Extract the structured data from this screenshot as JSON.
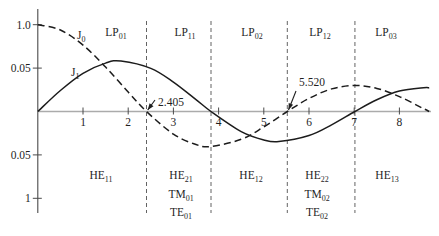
{
  "figure": {
    "background": "#ffffff",
    "text_color": "#1f1f1f",
    "curve_color": "#1c1c1c",
    "axis_color": "#ababab",
    "tick_color": "#4a4a4a",
    "cutoff_line_color": "#636363"
  },
  "chart_data": {
    "type": "line",
    "title": "",
    "xlabel": "",
    "ylabel": "",
    "xlim": [
      0,
      8.9
    ],
    "ylim": [
      -1.17,
      1.17
    ],
    "grid": false,
    "legend": "none",
    "x_ticks": [
      "1",
      "2",
      "3",
      "4",
      "5",
      "6",
      "7",
      "8"
    ],
    "y_ticks": [
      {
        "label": "1.0",
        "value": 1.0
      },
      {
        "label": "0.05",
        "value": 0.5
      },
      {
        "label": "0.05",
        "value": -0.5
      },
      {
        "label": "1",
        "value": -1.0
      }
    ],
    "series": [
      {
        "name": "J0",
        "label_main": "J",
        "label_sub": "0",
        "style": "dashed",
        "points": [
          [
            0,
            1.0
          ],
          [
            0.5,
            0.9385
          ],
          [
            1,
            0.7652
          ],
          [
            1.5,
            0.5118
          ],
          [
            2,
            0.2239
          ],
          [
            2.405,
            0.0
          ],
          [
            3,
            -0.2601
          ],
          [
            3.5,
            -0.3801
          ],
          [
            3.832,
            -0.4028
          ],
          [
            4.5,
            -0.3205
          ],
          [
            5,
            -0.1776
          ],
          [
            5.52,
            0.0
          ],
          [
            6,
            0.1506
          ],
          [
            6.5,
            0.2601
          ],
          [
            7.016,
            0.3001
          ],
          [
            7.5,
            0.2663
          ],
          [
            8,
            0.1717
          ],
          [
            8.5,
            0.0419
          ],
          [
            8.66,
            0.0
          ]
        ]
      },
      {
        "name": "J1",
        "label_main": "J",
        "label_sub": "1",
        "style": "solid",
        "points": [
          [
            0,
            0.0
          ],
          [
            0.5,
            0.2423
          ],
          [
            1,
            0.4401
          ],
          [
            1.5,
            0.5579
          ],
          [
            1.841,
            0.5819
          ],
          [
            2.5,
            0.4971
          ],
          [
            3,
            0.3391
          ],
          [
            3.5,
            0.1374
          ],
          [
            3.832,
            0.0
          ],
          [
            4.5,
            -0.2311
          ],
          [
            5,
            -0.3276
          ],
          [
            5.331,
            -0.3461
          ],
          [
            6,
            -0.2767
          ],
          [
            6.5,
            -0.1538
          ],
          [
            7.016,
            0.0
          ],
          [
            7.5,
            0.1352
          ],
          [
            8,
            0.2346
          ],
          [
            8.536,
            0.2731
          ],
          [
            8.66,
            0.2718
          ]
        ]
      }
    ],
    "cutoff_lines": [
      2.405,
      3.832,
      5.52,
      7.016
    ],
    "annotations": [
      {
        "label": "2.405",
        "x_value": 2.405
      },
      {
        "label": "5.520",
        "x_value": 5.52
      }
    ],
    "top_modes": [
      {
        "main": "LP",
        "sub": "01"
      },
      {
        "main": "LP",
        "sub": "11"
      },
      {
        "main": "LP",
        "sub": "02"
      },
      {
        "main": "LP",
        "sub": "12"
      },
      {
        "main": "LP",
        "sub": "03"
      }
    ],
    "bottom_modes": [
      {
        "rows": [
          {
            "main": "HE",
            "sub": "11"
          }
        ]
      },
      {
        "rows": [
          {
            "main": "HE",
            "sub": "21"
          },
          {
            "main": "TM",
            "sub": "01"
          },
          {
            "main": "TE",
            "sub": "01"
          }
        ]
      },
      {
        "rows": [
          {
            "main": "HE",
            "sub": "12"
          }
        ]
      },
      {
        "rows": [
          {
            "main": "HE",
            "sub": "22"
          },
          {
            "main": "TM",
            "sub": "02"
          },
          {
            "main": "TE",
            "sub": "02"
          }
        ]
      },
      {
        "rows": [
          {
            "main": "HE",
            "sub": "13"
          }
        ]
      }
    ]
  }
}
